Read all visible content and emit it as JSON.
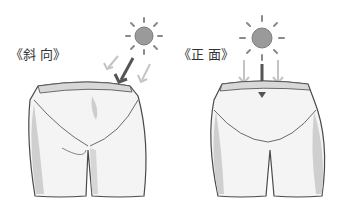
{
  "panels": [
    {
      "label": "《斜 向》",
      "view": "oblique",
      "light_direction": "diagonal"
    },
    {
      "label": "《正 面》",
      "view": "frontal",
      "light_direction": "vertical"
    }
  ],
  "colors": {
    "sun_fill": "#9a9a9a",
    "sun_rays": "#8a8a8a",
    "primary_arrow": "#555555",
    "secondary_arrow": "#bdbdbd",
    "outline": "#4a4a4a",
    "shadow": "#c8c8c8"
  }
}
